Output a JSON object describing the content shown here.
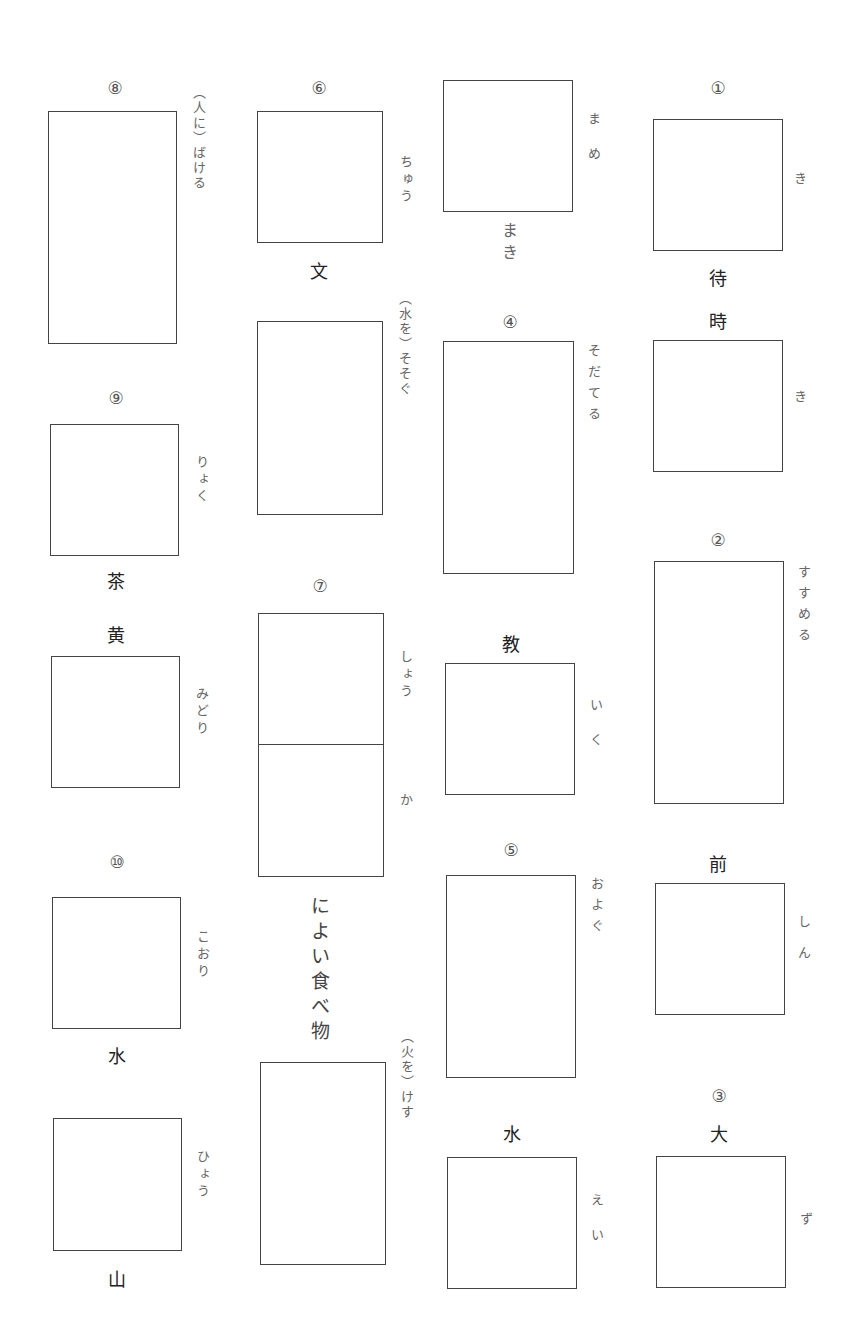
{
  "worksheet": {
    "col1": {
      "q1": {
        "number": "①",
        "reading_top": "き",
        "kanji_between": "待",
        "kanji_second": "時",
        "reading_bottom": "き"
      },
      "q2": {
        "number": "②",
        "reading": "すすめる",
        "kanji_above_second": "前",
        "reading_second": "しん"
      },
      "q3": {
        "number": "③",
        "kanji": "大",
        "reading": "ず"
      }
    },
    "col2": {
      "q_mame": {
        "reading": "まめ",
        "below": "まき"
      },
      "q4": {
        "number": "④",
        "reading": "そだてる",
        "kanji_second": "教",
        "reading_second": "いく"
      },
      "q5": {
        "number": "⑤",
        "reading": "およぐ",
        "kanji_second": "水",
        "reading_second": "えい"
      }
    },
    "col3": {
      "q6": {
        "number": "⑥",
        "reading": "ちゅう",
        "kanji_below": "文",
        "reading_second": "（水を）そそぐ"
      },
      "q7": {
        "number": "⑦",
        "reading_top": "しょう",
        "reading_bottom": "か",
        "below": "によい食べ物",
        "reading_second": "（火を）けす"
      }
    },
    "col4": {
      "q8": {
        "number": "⑧",
        "reading": "（人に）ばける"
      },
      "q9": {
        "number": "⑨",
        "reading": "りょく",
        "kanji_below": "茶",
        "kanji_second": "黄",
        "reading_second": "みどり"
      },
      "q10": {
        "number": "⑩",
        "reading": "こおり",
        "kanji_below": "水",
        "reading_second": "ひょう",
        "kanji_last": "山"
      }
    }
  }
}
